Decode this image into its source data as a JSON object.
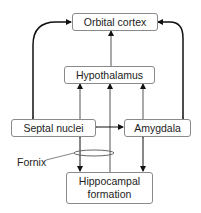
{
  "diagram": {
    "nodes": [
      {
        "id": "orbital",
        "label": "Orbital cortex"
      },
      {
        "id": "hypothalamus",
        "label": "Hypothalamus"
      },
      {
        "id": "septal",
        "label": "Septal nuclei"
      },
      {
        "id": "amygdala",
        "label": "Amygdala"
      },
      {
        "id": "hippocampal",
        "label": "Hippocampal formation",
        "lines": [
          "Hippocampal",
          "formation"
        ]
      }
    ],
    "annotations": {
      "fornix": "Fornix"
    },
    "edges": [
      {
        "from": "hypothalamus",
        "to": "orbital",
        "type": "one-way"
      },
      {
        "from": "septal",
        "to": "orbital",
        "type": "two-way",
        "curved": true
      },
      {
        "from": "amygdala",
        "to": "orbital",
        "type": "two-way",
        "curved": true
      },
      {
        "from": "septal",
        "to": "hypothalamus",
        "type": "one-way"
      },
      {
        "from": "hippocampal",
        "to": "hypothalamus",
        "type": "one-way"
      },
      {
        "from": "amygdala",
        "to": "hypothalamus",
        "type": "one-way"
      },
      {
        "from": "septal",
        "to": "amygdala",
        "type": "two-way"
      },
      {
        "from": "septal",
        "to": "hippocampal",
        "type": "two-way",
        "via": "fornix"
      },
      {
        "from": "amygdala",
        "to": "hippocampal",
        "type": "two-way"
      }
    ],
    "colors": {
      "line": "#222222",
      "box_border": "#8a8a8a"
    }
  }
}
